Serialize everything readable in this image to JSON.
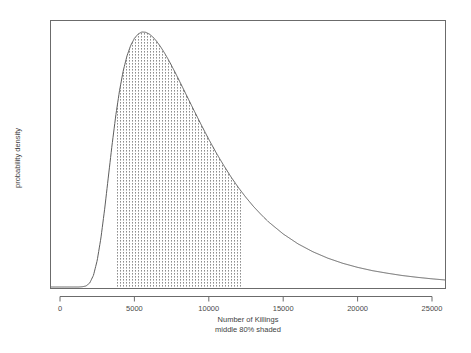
{
  "chart_data": {
    "type": "area",
    "title": "",
    "subtitle": "",
    "xlabel": "Number of Killings",
    "xlabel_sub": "middle 80% shaded",
    "ylabel": "probability density",
    "xlim": [
      -1100,
      26400
    ],
    "ylim": [
      0,
      1.08
    ],
    "grid": false,
    "legend": false,
    "legend_position": "none",
    "xticks": [
      0,
      5000,
      10000,
      15000,
      20000,
      25000
    ],
    "xticklabels": [
      "0",
      "5000",
      "10000",
      "15000",
      "20000",
      "25000"
    ],
    "yticks": [],
    "yticklabels": [],
    "shaded_interval": [
      3700,
      12300
    ],
    "shaded_label": "middle 80% shaded",
    "shade_style": "dotted-crosshatch",
    "distribution": "lognormal",
    "mode": 5400,
    "median": 6650,
    "series": [
      {
        "name": "probability density",
        "x": [
          0,
          250,
          500,
          750,
          1000,
          1250,
          1500,
          1750,
          2000,
          2250,
          2500,
          2750,
          3000,
          3250,
          3500,
          3750,
          4000,
          4250,
          4500,
          4750,
          5000,
          5250,
          5500,
          5750,
          6000,
          6250,
          6500,
          6750,
          7000,
          7250,
          7500,
          7750,
          8000,
          8500,
          9000,
          9500,
          10000,
          10500,
          11000,
          11500,
          12000,
          12500,
          13000,
          13500,
          14000,
          15000,
          16000,
          17000,
          18000,
          19000,
          20000,
          21000,
          22000,
          23000,
          24000,
          25000,
          26000
        ],
        "values": [
          0.0,
          0.0,
          0.0,
          0.0,
          0.0,
          0.0,
          0.001,
          0.004,
          0.016,
          0.046,
          0.104,
          0.192,
          0.305,
          0.432,
          0.558,
          0.673,
          0.77,
          0.848,
          0.906,
          0.947,
          0.975,
          0.992,
          1.0,
          0.999,
          0.992,
          0.98,
          0.963,
          0.943,
          0.92,
          0.895,
          0.868,
          0.84,
          0.811,
          0.752,
          0.693,
          0.635,
          0.579,
          0.526,
          0.477,
          0.431,
          0.389,
          0.351,
          0.316,
          0.285,
          0.256,
          0.208,
          0.169,
          0.138,
          0.113,
          0.093,
          0.077,
          0.064,
          0.054,
          0.045,
          0.038,
          0.032,
          0.027
        ]
      }
    ]
  },
  "axis": {
    "x_title": "Number of Killings",
    "x_subtitle": "middle 80% shaded",
    "y_title": "probability density",
    "tick_0": "0",
    "tick_5000": "5000",
    "tick_10000": "10000",
    "tick_15000": "15000",
    "tick_20000": "20000",
    "tick_25000": "25000"
  },
  "colors": {
    "frame": "#6b6b6b",
    "curve": "#5e5e5e",
    "hatch": "#8e8e8e",
    "text": "#3f3f3f",
    "background": "#ffffff"
  }
}
